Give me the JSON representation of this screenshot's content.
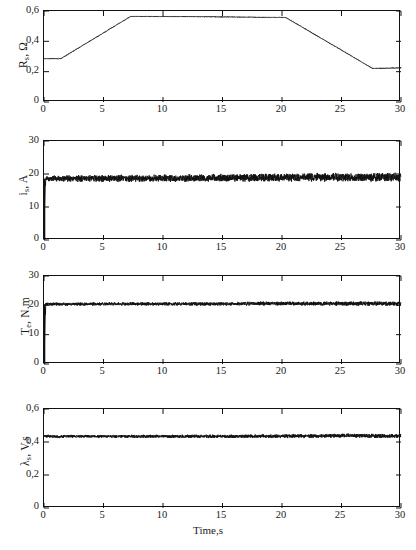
{
  "figure": {
    "xlabel": "Time,s",
    "caption": "",
    "line_color": "#111111",
    "axis_color": "#111111"
  },
  "chart_data": [
    {
      "type": "line",
      "panel_index": 0,
      "title": "",
      "ylabel_text": "R",
      "ylabel_sub": "s",
      "ylabel_unit": ", Ω",
      "ylabel_full": "R_s , Ω",
      "xlabel": "",
      "xlim": [
        0,
        30
      ],
      "ylim": [
        0,
        0.6
      ],
      "xticks": [
        0,
        5,
        10,
        15,
        20,
        25,
        30
      ],
      "xticklabels": [
        "0",
        "5",
        "10",
        "15",
        "20",
        "25",
        "30"
      ],
      "yticks": [
        0,
        0.2,
        0.4,
        0.6
      ],
      "yticklabels": [
        "0",
        "0,2",
        "0,4",
        "0,6"
      ],
      "grid": false,
      "legend": null,
      "noise_amplitude": 0.004,
      "x": [
        0,
        1.4,
        7.3,
        20.3,
        27.6,
        30
      ],
      "values": [
        0.285,
        0.285,
        0.565,
        0.558,
        0.222,
        0.225
      ]
    },
    {
      "type": "line",
      "panel_index": 1,
      "title": "",
      "ylabel_text": "i",
      "ylabel_sub": "s",
      "ylabel_unit": ", A",
      "ylabel_full": "i_s , A",
      "xlabel": "",
      "xlim": [
        0,
        30
      ],
      "ylim": [
        0,
        30
      ],
      "xticks": [
        0,
        5,
        10,
        15,
        20,
        25,
        30
      ],
      "xticklabels": [
        "0",
        "5",
        "10",
        "15",
        "20",
        "25",
        "30"
      ],
      "yticks": [
        0,
        10,
        20,
        30
      ],
      "yticklabels": [
        "0",
        "10",
        "20",
        "30"
      ],
      "grid": false,
      "legend": null,
      "noise_amplitude": 1.0,
      "startup_dip": 5.2,
      "x": [
        0,
        0.15,
        2,
        6,
        10,
        14,
        18,
        22,
        26,
        30
      ],
      "values": [
        5.2,
        18.6,
        18.6,
        18.7,
        18.7,
        18.8,
        18.9,
        19.0,
        19.0,
        19.0
      ]
    },
    {
      "type": "line",
      "panel_index": 2,
      "title": "",
      "ylabel_text": "T",
      "ylabel_sub": "e",
      "ylabel_unit": ", N.m",
      "ylabel_full": "T_e , N.m",
      "xlabel": "",
      "xlim": [
        0,
        30
      ],
      "ylim": [
        0,
        30
      ],
      "xticks": [
        0,
        5,
        10,
        15,
        20,
        25,
        30
      ],
      "xticklabels": [
        "0",
        "5",
        "10",
        "15",
        "20",
        "25",
        "30"
      ],
      "yticks": [
        0,
        10,
        20,
        30
      ],
      "yticklabels": [
        "0",
        "10",
        "20",
        "30"
      ],
      "grid": false,
      "legend": null,
      "noise_amplitude": 0.55,
      "startup_dip": 0.4,
      "x": [
        0,
        0.15,
        2,
        6,
        10,
        14,
        18,
        22,
        26,
        30
      ],
      "values": [
        0.4,
        20.4,
        20.4,
        20.5,
        20.5,
        20.5,
        20.6,
        20.6,
        20.6,
        20.6
      ]
    },
    {
      "type": "line",
      "panel_index": 3,
      "title": "",
      "ylabel_text": "λ",
      "ylabel_sub": "s",
      "ylabel_unit": ", V.s",
      "ylabel_full": "λ_s , V.s",
      "xlabel": "Time,s",
      "xlim": [
        0,
        30
      ],
      "ylim": [
        0,
        0.6
      ],
      "xticks": [
        0,
        5,
        10,
        15,
        20,
        25,
        30
      ],
      "xticklabels": [
        "0",
        "5",
        "10",
        "15",
        "20",
        "25",
        "30"
      ],
      "yticks": [
        0,
        0.2,
        0.4,
        0.6
      ],
      "yticklabels": [
        "0",
        "0,2",
        "0,4",
        "0,6"
      ],
      "grid": false,
      "legend": null,
      "noise_amplitude": 0.009,
      "x": [
        0,
        1.0,
        2,
        6,
        10,
        14,
        18,
        22,
        25.5,
        28,
        30
      ],
      "values": [
        0.437,
        0.432,
        0.434,
        0.434,
        0.434,
        0.434,
        0.435,
        0.436,
        0.44,
        0.436,
        0.437
      ]
    }
  ]
}
